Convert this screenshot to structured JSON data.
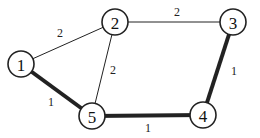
{
  "diagram": {
    "type": "weighted-graph",
    "nodes": [
      {
        "id": "1",
        "label": "1",
        "x": 21,
        "y": 64
      },
      {
        "id": "2",
        "label": "2",
        "x": 115,
        "y": 22
      },
      {
        "id": "3",
        "label": "3",
        "x": 233,
        "y": 22
      },
      {
        "id": "4",
        "label": "4",
        "x": 203,
        "y": 115
      },
      {
        "id": "5",
        "label": "5",
        "x": 92,
        "y": 116
      }
    ],
    "edges": [
      {
        "from": "1",
        "to": "2",
        "weight": "2",
        "highlighted": false
      },
      {
        "from": "2",
        "to": "3",
        "weight": "2",
        "highlighted": false
      },
      {
        "from": "2",
        "to": "5",
        "weight": "2",
        "highlighted": false
      },
      {
        "from": "1",
        "to": "5",
        "weight": "1",
        "highlighted": true
      },
      {
        "from": "5",
        "to": "4",
        "weight": "1",
        "highlighted": true
      },
      {
        "from": "4",
        "to": "3",
        "weight": "1",
        "highlighted": true
      }
    ]
  }
}
